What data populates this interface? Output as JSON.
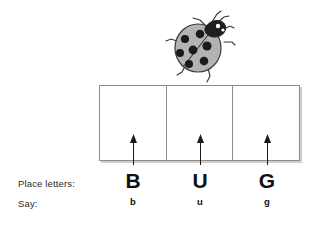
{
  "worksheet": {
    "illustration": {
      "name": "ladybug",
      "body_color": "#b3b3b3",
      "spot_color": "#1a1a1a",
      "outline_color": "#333333",
      "spot_count": 7
    },
    "boxes": {
      "count": 3,
      "cells": [
        {
          "value": ""
        },
        {
          "value": ""
        },
        {
          "value": ""
        }
      ],
      "border_color": "#8c8c8c",
      "fill_color": "#ffffff",
      "shadow_color": "#cfcfcf"
    },
    "arrows": {
      "count": 3,
      "direction": "up",
      "color": "#1a1a1a"
    },
    "rows": [
      {
        "id": "place-letters",
        "label": "Place letters:",
        "values": [
          "B",
          "U",
          "G"
        ]
      },
      {
        "id": "say",
        "label": "Say:",
        "values": [
          "b",
          "u",
          "g"
        ]
      }
    ],
    "word": "BUG"
  }
}
